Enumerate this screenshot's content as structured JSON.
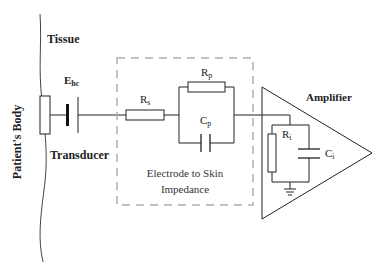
{
  "diagram": {
    "labels": {
      "body": "Patient's Body",
      "tissue": "Tissue",
      "ehc_main": "E",
      "ehc_sub": "hc",
      "transducer": "Transducer",
      "rs_main": "R",
      "rs_sub": "s",
      "rp_main": "R",
      "rp_sub": "p",
      "cp_main": "C",
      "cp_sub": "p",
      "box_line1": "Electrode to Skin",
      "box_line2": "Impedance",
      "amplifier": "Amplifier",
      "ri_main": "R",
      "ri_sub": "i",
      "ci_main": "C",
      "ci_sub": "i"
    },
    "colors": {
      "line": "#1a1a1a",
      "dashed_box": "#b0b0b0",
      "text": "#222222"
    }
  }
}
